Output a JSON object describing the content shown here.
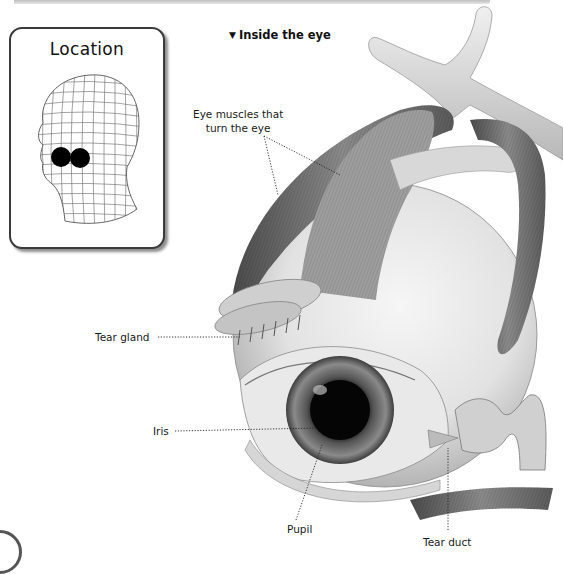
{
  "card": {
    "title": "Location",
    "figure": "wireframe-head-with-eyes-highlighted"
  },
  "heading": {
    "marker": "▼",
    "text": "Inside the eye"
  },
  "labels": {
    "eye_muscles_line1": "Eye muscles that",
    "eye_muscles_line2": "turn the eye",
    "tear_gland": "Tear gland",
    "iris": "Iris",
    "pupil": "Pupil",
    "tear_duct": "Tear duct"
  },
  "colors": {
    "ink": "#1a1a1a",
    "card_border": "#3a3a3a",
    "background": "#ffffff",
    "eye_marker": "#000000"
  }
}
